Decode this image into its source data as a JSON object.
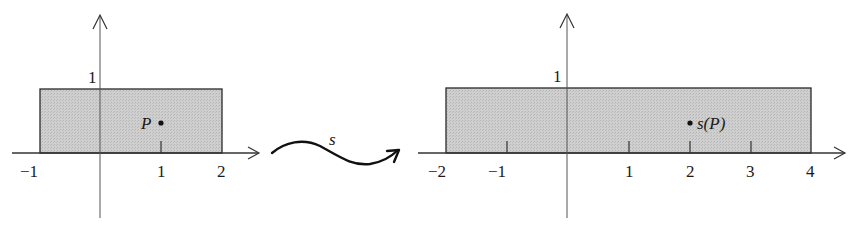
{
  "figure": {
    "colors": {
      "fill": "#c8c8c8",
      "stroke": "#2a2a2a",
      "axis": "#444444"
    }
  },
  "left_plot": {
    "y_tick_label": "1",
    "x_tick_labels": [
      "−1",
      "1",
      "2"
    ],
    "point_label": "P",
    "rect": {
      "x_min": -1,
      "x_max": 2,
      "y_min": 0,
      "y_max": 1
    },
    "point": {
      "x": 1,
      "y": 0.5
    }
  },
  "mapping": {
    "label": "s"
  },
  "right_plot": {
    "y_tick_label": "1",
    "x_tick_labels": [
      "−2",
      "−1",
      "1",
      "2",
      "3",
      "4"
    ],
    "point_label": "s(P)",
    "rect": {
      "x_min": -2,
      "x_max": 4,
      "y_min": 0,
      "y_max": 1
    },
    "point": {
      "x": 2,
      "y": 0.5
    }
  }
}
